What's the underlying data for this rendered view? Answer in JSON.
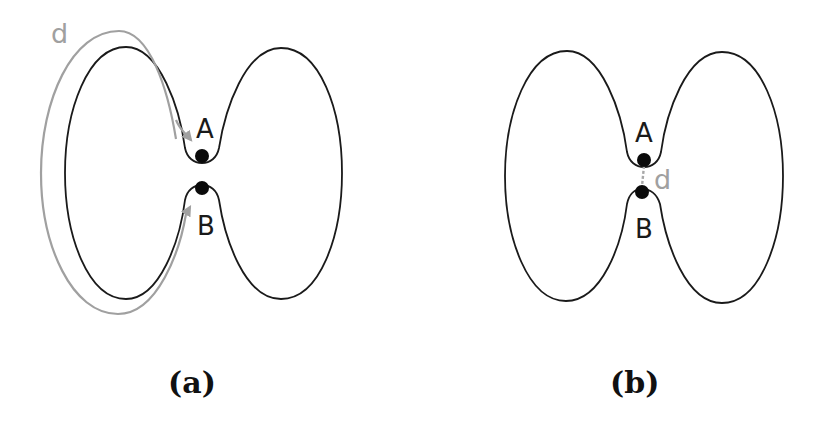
{
  "figure": {
    "panels": [
      {
        "id": "a",
        "caption": "(a)",
        "point_labels": {
          "top": "A",
          "bottom": "B"
        },
        "distance_label": "d",
        "distance_type": "geodesic path along the curve from A to B (gray arc with arrows)"
      },
      {
        "id": "b",
        "caption": "(b)",
        "point_labels": {
          "top": "A",
          "bottom": "B"
        },
        "distance_label": "d",
        "distance_type": "straight-line distance between A and B (gray dashed segment)"
      }
    ],
    "colors": {
      "outline": "#1a1a1a",
      "distance": "#a0a0a0",
      "points": "#0a0a0a",
      "background": "#ffffff"
    }
  }
}
